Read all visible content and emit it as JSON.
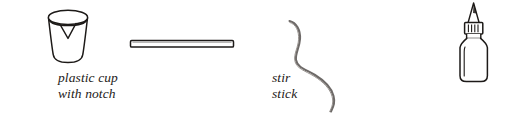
{
  "figure": {
    "background_color": "#ffffff",
    "ink_color": "#1d1a18",
    "wire_color": "#6e6a68",
    "items": [
      {
        "id": "plastic-cup",
        "icon": "plastic-cup-with-notch-icon",
        "label": "plastic cup\nwith notch",
        "label_lines": [
          "plastic cup",
          "with notch"
        ]
      },
      {
        "id": "stir-stick",
        "icon": "stir-stick-icon",
        "label": "stir stick",
        "label_lines": [
          "stir stick"
        ]
      },
      {
        "id": "wire",
        "icon": "wire-icon",
        "label": "wire",
        "label_lines": [
          "wire"
        ]
      },
      {
        "id": "liquid-detergent",
        "icon": "liquid-detergent-bottle-icon",
        "label": "liquid\ndetergent",
        "label_lines": [
          "liquid",
          "detergent"
        ]
      }
    ]
  }
}
